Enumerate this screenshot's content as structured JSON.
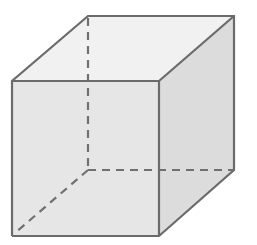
{
  "diagram": {
    "type": "cube",
    "projection": "oblique",
    "colors": {
      "background": "#ffffff",
      "edge": "#6b6b6b",
      "hidden_edge": "#707070",
      "front_face": "#e6e6e6",
      "top_face": "#f1f1f1",
      "right_face": "#dcdcdc"
    },
    "vertices": {
      "front_top_left": [
        12,
        81
      ],
      "front_top_right": [
        159,
        81
      ],
      "front_bottom_left": [
        12,
        236
      ],
      "front_bottom_right": [
        159,
        236
      ],
      "back_top_left": [
        88,
        16
      ],
      "back_top_right": [
        234,
        16
      ],
      "back_bottom_right": [
        234,
        170
      ],
      "back_bottom_left": [
        88,
        170
      ]
    },
    "visible_edges": 9,
    "hidden_edges": 3
  }
}
